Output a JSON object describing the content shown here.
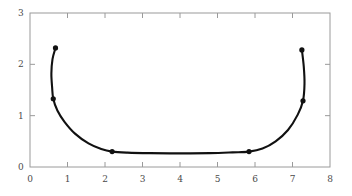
{
  "chart_data": {
    "type": "line",
    "title": "",
    "subtitle": "",
    "xlabel": "",
    "ylabel": "",
    "xlim": [
      0,
      8
    ],
    "ylim": [
      0,
      3
    ],
    "grid": false,
    "legend": null,
    "xticks": [
      0,
      1,
      2,
      3,
      4,
      5,
      6,
      7,
      8
    ],
    "xtick_labels": [
      "0",
      "1",
      "2",
      "3",
      "4",
      "5",
      "6",
      "7",
      "8"
    ],
    "yticks": [
      0,
      1,
      2,
      3
    ],
    "ytick_labels": [
      "0",
      "1",
      "2",
      "3"
    ],
    "line_color": "#111111",
    "marker_color": "#111111",
    "axis_color": "#9a9a9a",
    "background_color": "#ffffff",
    "series": [
      {
        "name": "curve",
        "x": [
          0.68,
          0.6,
          0.57,
          0.59,
          0.62,
          0.73,
          0.92,
          1.2,
          1.56,
          1.9,
          2.19,
          2.6,
          3.2,
          4.0,
          4.8,
          5.4,
          5.84,
          6.2,
          6.55,
          6.88,
          7.14,
          7.28,
          7.32,
          7.3,
          7.25
        ],
        "y": [
          2.32,
          2.1,
          1.82,
          1.55,
          1.33,
          1.1,
          0.88,
          0.65,
          0.46,
          0.35,
          0.3,
          0.28,
          0.27,
          0.265,
          0.27,
          0.285,
          0.3,
          0.36,
          0.5,
          0.72,
          1.02,
          1.29,
          1.62,
          1.96,
          2.28
        ]
      }
    ],
    "markers": [
      {
        "x": 0.68,
        "y": 2.32
      },
      {
        "x": 0.62,
        "y": 1.33
      },
      {
        "x": 2.19,
        "y": 0.3
      },
      {
        "x": 5.84,
        "y": 0.3
      },
      {
        "x": 7.28,
        "y": 1.29
      },
      {
        "x": 7.25,
        "y": 2.28
      }
    ]
  }
}
